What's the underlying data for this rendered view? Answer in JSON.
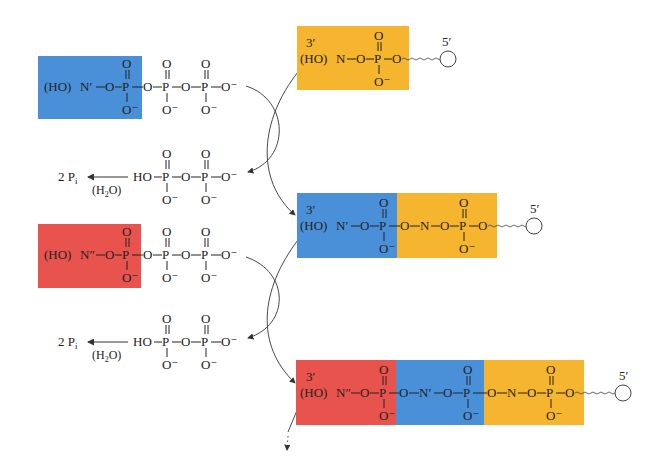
{
  "colors": {
    "blue": "#4a90d9",
    "yellow": "#f6b52e",
    "red": "#e8534e",
    "ink": "#222222",
    "arrow": "#333333"
  },
  "labels": {
    "ho": "(HO)",
    "ho_plain": "HO",
    "three_prime": "3′",
    "five_prime": "5′",
    "n_prime": "N′",
    "n_double_prime": "N″",
    "n": "N",
    "o": "O",
    "p": "P",
    "o_minus": "O⁻",
    "two_pi": "2  P",
    "pi_sub": "i",
    "water": "(H",
    "water_sub": "2",
    "water_end": "O)"
  },
  "left_column": {
    "dntp_1": {
      "base": "N′",
      "box_color": "blue",
      "phosphates": 3
    },
    "ppi_1": {
      "product": "2 Pi",
      "condition": "(H2O)"
    },
    "dntp_2": {
      "base": "N″",
      "box_color": "red",
      "phosphates": 3
    },
    "ppi_2": {
      "product": "2 Pi",
      "condition": "(H2O)"
    }
  },
  "right_column": {
    "strand_1": {
      "end_3": "3′",
      "end_5": "5′",
      "segments": [
        {
          "base": "N",
          "color": "yellow"
        }
      ]
    },
    "strand_2": {
      "end_3": "3′",
      "end_5": "5′",
      "segments": [
        {
          "base": "N′",
          "color": "blue"
        },
        {
          "base": "N",
          "color": "yellow"
        }
      ]
    },
    "strand_3": {
      "end_3": "3′",
      "end_5": "5′",
      "segments": [
        {
          "base": "N″",
          "color": "red"
        },
        {
          "base": "N′",
          "color": "blue"
        },
        {
          "base": "N",
          "color": "yellow"
        }
      ]
    }
  }
}
